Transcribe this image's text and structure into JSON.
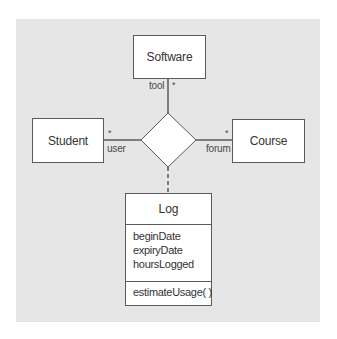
{
  "diagram": {
    "type": "UML n-ary association with association class",
    "colors": {
      "background": "#e6e6e6",
      "box_fill": "#ffffff",
      "stroke": "#5a5a5a",
      "text": "#333333"
    },
    "classes": [
      {
        "id": "software",
        "name": "Software"
      },
      {
        "id": "student",
        "name": "Student"
      },
      {
        "id": "course",
        "name": "Course"
      }
    ],
    "association": {
      "shape": "diamond",
      "ends": [
        {
          "class": "software",
          "role": "tool",
          "multiplicity": "*"
        },
        {
          "class": "student",
          "role": "user",
          "multiplicity": "*"
        },
        {
          "class": "course",
          "role": "forum",
          "multiplicity": "*"
        }
      ]
    },
    "association_class": {
      "name": "Log",
      "attributes": [
        "beginDate",
        "expiryDate",
        "hoursLogged"
      ],
      "operations": [
        "estimateUsage( )"
      ],
      "link": "dashed"
    }
  }
}
